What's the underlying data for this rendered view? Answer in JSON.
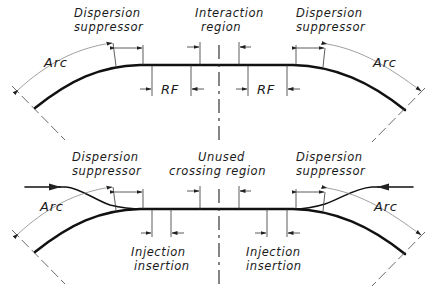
{
  "top_diagram": {
    "name": "collision layout",
    "labels": {
      "dispersion_left": [
        "Dispersion",
        "suppressor"
      ],
      "interaction": [
        "Interaction",
        "region"
      ],
      "dispersion_right": [
        "Dispersion",
        "suppressor"
      ],
      "arc_left": "Arc",
      "arc_right": "Arc",
      "rf_left": "RF",
      "rf_right": "RF"
    }
  },
  "bottom_diagram": {
    "name": "injection layout",
    "labels": {
      "dispersion_left": [
        "Dispersion",
        "suppressor"
      ],
      "unused": [
        "Unused",
        "crossing region"
      ],
      "dispersion_right": [
        "Dispersion",
        "suppressor"
      ],
      "arc_left": "Arc",
      "arc_right": "Arc",
      "injection_left": [
        "Injection",
        "insertion"
      ],
      "injection_right": [
        "Injection",
        "insertion"
      ]
    }
  }
}
